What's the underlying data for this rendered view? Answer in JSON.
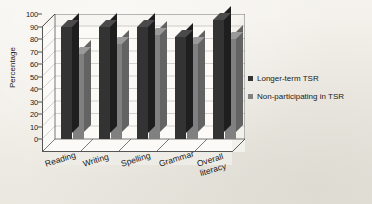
{
  "chart_data": {
    "type": "bar",
    "title": "",
    "subtitle": "",
    "xlabel": "",
    "ylabel": "Percentage",
    "ylim": [
      0,
      100
    ],
    "yticks": [
      0,
      10,
      20,
      30,
      40,
      50,
      60,
      70,
      80,
      90,
      100
    ],
    "grid": true,
    "legend_position": "right",
    "style": "3d-clustered-column",
    "categories": [
      "Reading",
      "Writing",
      "Spelling",
      "Grammar",
      "Overall literacy"
    ],
    "category_label_lines": [
      [
        "Reading"
      ],
      [
        "Writing"
      ],
      [
        "Spelling"
      ],
      [
        "Grammar"
      ],
      [
        "Overall",
        "literacy"
      ]
    ],
    "series": [
      {
        "name": "Longer-term TSR",
        "color": "#333333",
        "values": [
          90,
          90,
          90,
          82,
          95
        ]
      },
      {
        "name": "Non-participating in TSR",
        "color": "#808080",
        "values": [
          68,
          76,
          83,
          76,
          80
        ]
      }
    ]
  },
  "axis": {
    "y_title": "Percentage",
    "y_ticks": [
      "0",
      "10",
      "20",
      "30",
      "40",
      "50",
      "60",
      "70",
      "80",
      "90",
      "100"
    ]
  },
  "legend": {
    "items": [
      {
        "label": "Longer-term TSR",
        "color": "#333333"
      },
      {
        "label": "Non-participating in TSR",
        "color": "#808080"
      }
    ]
  },
  "colors": {
    "series_dark": "#333333",
    "series_grey": "#808080",
    "background": "#f2f0ea",
    "plot_face": "#fbfaf7",
    "axis_line": "#555555",
    "grid_line": "#b9b6ae",
    "text": "#1a1a1a"
  }
}
